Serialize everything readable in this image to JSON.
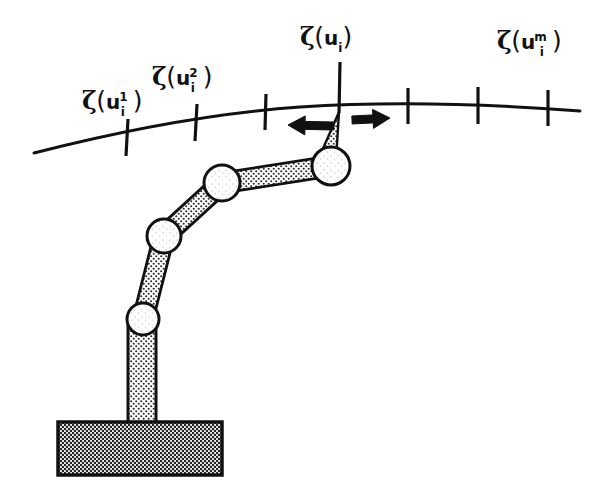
{
  "figure": {
    "background_color": "#ffffff",
    "ink_color": "#111111",
    "width": 607,
    "height": 499
  },
  "labels": [
    {
      "id": "label-1",
      "name": "surface-point-label-1",
      "zeta": "ζ",
      "open": "(",
      "base": "u",
      "superscript": "1",
      "subscript": "i",
      "close": ")",
      "full_text": "ζ(uᵢ¹)",
      "x": 82,
      "y": 88
    },
    {
      "id": "label-2",
      "name": "surface-point-label-2",
      "zeta": "ζ",
      "open": "(",
      "base": "u",
      "superscript": "2",
      "subscript": "i",
      "close": ")",
      "full_text": "ζ(uᵢ²)",
      "x": 152,
      "y": 64
    },
    {
      "id": "label-3",
      "name": "surface-point-label-current",
      "zeta": "ζ",
      "open": "(",
      "base": "u",
      "superscript": "",
      "subscript": "i",
      "close": ")",
      "full_text": "ζ(uᵢ)",
      "x": 300,
      "y": 24
    },
    {
      "id": "label-4",
      "name": "surface-point-label-m",
      "zeta": "ζ",
      "open": "(",
      "base": "u",
      "superscript": "m",
      "subscript": "i",
      "close": ")",
      "full_text": "ζ(uᵢᵐ)",
      "x": 497,
      "y": 28
    }
  ],
  "curve": {
    "name": "surface-curve",
    "stroke_width": 3,
    "path": "M 34 153 C 120 131 215 113 300 107 C 390 101 490 104 580 111"
  },
  "ticks": [
    {
      "name": "tick-mark-1",
      "x1": 128,
      "y1": 119,
      "x2": 126,
      "y2": 156
    },
    {
      "name": "tick-mark-2",
      "x1": 197,
      "y1": 104,
      "x2": 195,
      "y2": 141
    },
    {
      "name": "tick-mark-3",
      "x1": 266,
      "y1": 94,
      "x2": 265,
      "y2": 130
    },
    {
      "name": "tick-mark-current",
      "x1": 340,
      "y1": 62,
      "x2": 339,
      "y2": 113
    },
    {
      "name": "tick-mark-5",
      "x1": 408,
      "y1": 88,
      "x2": 408,
      "y2": 124
    },
    {
      "name": "tick-mark-6",
      "x1": 478,
      "y1": 87,
      "x2": 478,
      "y2": 124
    },
    {
      "name": "tick-mark-7",
      "x1": 548,
      "y1": 90,
      "x2": 548,
      "y2": 126
    }
  ],
  "arrows": [
    {
      "name": "arrow-left",
      "direction": "left",
      "tail_x": 334,
      "tail_y": 126,
      "head_x": 288,
      "head_y": 125
    },
    {
      "name": "arrow-right",
      "direction": "right",
      "tail_x": 352,
      "tail_y": 120,
      "head_x": 390,
      "head_y": 118
    }
  ],
  "manipulator": {
    "name": "robot-arm",
    "joints": [
      {
        "name": "joint-end-effector",
        "cx": 331,
        "cy": 166,
        "r": 19
      },
      {
        "name": "joint-elbow-upper",
        "cx": 222,
        "cy": 183,
        "r": 18
      },
      {
        "name": "joint-elbow-lower",
        "cx": 164,
        "cy": 236,
        "r": 17
      },
      {
        "name": "joint-shoulder",
        "cx": 143,
        "cy": 319,
        "r": 16
      }
    ],
    "links": [
      {
        "name": "link-forearm",
        "from": 1,
        "to": 0,
        "half_width": 10
      },
      {
        "name": "link-upperarm",
        "from": 2,
        "to": 1,
        "half_width": 10
      },
      {
        "name": "link-shoulder-arm",
        "from": 3,
        "to": 2,
        "half_width": 10
      }
    ],
    "column": {
      "name": "base-column",
      "x": 128,
      "y": 318,
      "width": 28,
      "height": 110
    },
    "base": {
      "name": "base-platform",
      "x": 58,
      "y": 422,
      "width": 164,
      "height": 53
    },
    "tool_tip": {
      "name": "tool-tip-stem",
      "tip_x": 339,
      "tip_y": 112,
      "base_left_x": 318,
      "base_right_x": 336,
      "base_y": 160
    }
  }
}
